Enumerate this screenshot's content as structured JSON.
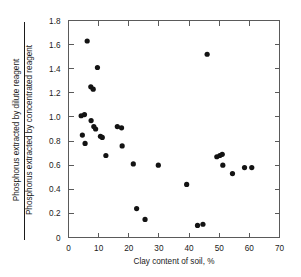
{
  "chart_data": {
    "type": "scatter",
    "title": "",
    "xlabel": "Clay content of soil, %",
    "ylabel_numerator": "Phosphorus extracted by dilute reagent",
    "ylabel_denominator": "Phosphorus extracted by concentrated reagent",
    "xlim": [
      0,
      70
    ],
    "ylim": [
      0,
      1.8
    ],
    "xticks": [
      0,
      10,
      20,
      30,
      40,
      50,
      60,
      70
    ],
    "xtick_labels": [
      "0",
      "10",
      "20",
      "30",
      "40",
      "50",
      "60",
      "70"
    ],
    "yticks": [
      0,
      0.2,
      0.4,
      0.6,
      0.8,
      1.0,
      1.2,
      1.4,
      1.6,
      1.8
    ],
    "ytick_labels": [
      "0",
      "0.2",
      "0.4",
      "0.6",
      "0.8",
      "1.0",
      "1.2",
      "1.4",
      "1.6",
      "1.8"
    ],
    "grid": false,
    "legend": false,
    "marker": "filled-circle",
    "marker_color": "#131313",
    "points": [
      {
        "x": 4.2,
        "y": 1.01
      },
      {
        "x": 4.6,
        "y": 0.85
      },
      {
        "x": 5.3,
        "y": 1.02
      },
      {
        "x": 5.5,
        "y": 0.78
      },
      {
        "x": 6.2,
        "y": 1.63
      },
      {
        "x": 7.4,
        "y": 1.25
      },
      {
        "x": 7.5,
        "y": 0.97
      },
      {
        "x": 8.2,
        "y": 1.23
      },
      {
        "x": 8.4,
        "y": 0.92
      },
      {
        "x": 9.0,
        "y": 0.9
      },
      {
        "x": 9.6,
        "y": 1.41
      },
      {
        "x": 10.6,
        "y": 0.84
      },
      {
        "x": 11.2,
        "y": 0.83
      },
      {
        "x": 12.4,
        "y": 0.68
      },
      {
        "x": 16.2,
        "y": 0.92
      },
      {
        "x": 17.6,
        "y": 0.91
      },
      {
        "x": 17.8,
        "y": 0.76
      },
      {
        "x": 21.5,
        "y": 0.61
      },
      {
        "x": 22.6,
        "y": 0.24
      },
      {
        "x": 25.4,
        "y": 0.15
      },
      {
        "x": 29.8,
        "y": 0.6
      },
      {
        "x": 39.2,
        "y": 0.44
      },
      {
        "x": 42.8,
        "y": 0.1
      },
      {
        "x": 44.6,
        "y": 0.11
      },
      {
        "x": 46.0,
        "y": 1.52
      },
      {
        "x": 49.2,
        "y": 0.67
      },
      {
        "x": 50.2,
        "y": 0.68
      },
      {
        "x": 51.0,
        "y": 0.69
      },
      {
        "x": 51.2,
        "y": 0.6
      },
      {
        "x": 54.4,
        "y": 0.53
      },
      {
        "x": 58.4,
        "y": 0.58
      },
      {
        "x": 60.8,
        "y": 0.58
      }
    ]
  }
}
